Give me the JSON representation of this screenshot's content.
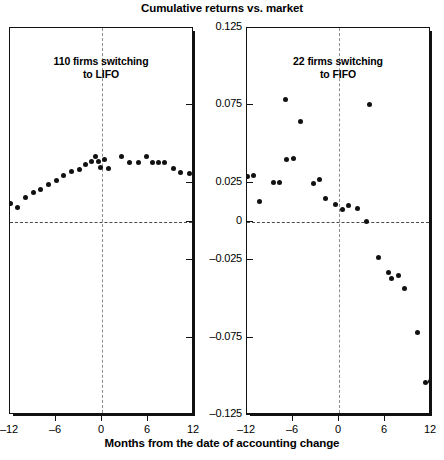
{
  "chart_data": {
    "type": "scatter",
    "title": "Cumulative returns vs. market",
    "xlabel": "Months from the date of accounting change",
    "ylabel": "",
    "xlim": [
      -12,
      12
    ],
    "ylim": [
      -0.125,
      0.125
    ],
    "xticks": [
      -12,
      -6,
      0,
      6,
      12
    ],
    "xticklabels": [
      "–12",
      "–6",
      "0",
      "6",
      "12"
    ],
    "yticks": [
      0.125,
      0.075,
      0.025,
      0,
      -0.025,
      -0.075,
      -0.125
    ],
    "yticklabels": [
      "0.125",
      "0.075",
      "0.025",
      "0",
      "–0.025",
      "–0.075",
      "–0.125"
    ],
    "grid": false,
    "legend": "none",
    "reference_lines": [
      {
        "type": "vertical",
        "x": 0,
        "style": "dashed"
      },
      {
        "type": "horizontal",
        "y": 0,
        "style": "dashed"
      }
    ],
    "panels": [
      {
        "id": "left",
        "annotation": "110 firms switching\nto LIFO",
        "annotation_line1": "110 firms switching",
        "annotation_line2": "to LIFO",
        "series": [
          {
            "name": "110 firms switching to LIFO",
            "points": [
              {
                "x": -12.0,
                "y": 0.0118
              },
              {
                "x": -11.0,
                "y": 0.009
              },
              {
                "x": -10.0,
                "y": 0.0155
              },
              {
                "x": -9.0,
                "y": 0.019
              },
              {
                "x": -8.0,
                "y": 0.0205
              },
              {
                "x": -7.0,
                "y": 0.024
              },
              {
                "x": -6.0,
                "y": 0.0268
              },
              {
                "x": -5.0,
                "y": 0.03
              },
              {
                "x": -4.0,
                "y": 0.0322
              },
              {
                "x": -3.0,
                "y": 0.0338
              },
              {
                "x": -2.2,
                "y": 0.037
              },
              {
                "x": -1.4,
                "y": 0.0385
              },
              {
                "x": -0.8,
                "y": 0.0418
              },
              {
                "x": -0.5,
                "y": 0.0388
              },
              {
                "x": -0.2,
                "y": 0.0352
              },
              {
                "x": 0.3,
                "y": 0.0398
              },
              {
                "x": 0.9,
                "y": 0.0345
              },
              {
                "x": 2.6,
                "y": 0.0418
              },
              {
                "x": 3.6,
                "y": 0.0378
              },
              {
                "x": 4.8,
                "y": 0.038
              },
              {
                "x": 5.8,
                "y": 0.0418
              },
              {
                "x": 6.6,
                "y": 0.0378
              },
              {
                "x": 7.4,
                "y": 0.0378
              },
              {
                "x": 8.2,
                "y": 0.0378
              },
              {
                "x": 9.3,
                "y": 0.034
              },
              {
                "x": 10.2,
                "y": 0.0318
              },
              {
                "x": 11.4,
                "y": 0.0312
              }
            ]
          }
        ]
      },
      {
        "id": "right",
        "annotation": "22 firms switching\nto FIFO",
        "annotation_line1": "22 firms switching",
        "annotation_line2": "to FIFO",
        "series": [
          {
            "name": "22 firms switching to FIFO",
            "points": [
              {
                "x": -11.9,
                "y": 0.0288
              },
              {
                "x": -11.2,
                "y": 0.03
              },
              {
                "x": -10.4,
                "y": 0.013
              },
              {
                "x": -8.6,
                "y": 0.025
              },
              {
                "x": -7.8,
                "y": 0.0255
              },
              {
                "x": -7.0,
                "y": 0.0785
              },
              {
                "x": -6.8,
                "y": 0.04
              },
              {
                "x": -5.9,
                "y": 0.0405
              },
              {
                "x": -5.0,
                "y": 0.0645
              },
              {
                "x": -3.3,
                "y": 0.0248
              },
              {
                "x": -2.6,
                "y": 0.0272
              },
              {
                "x": -1.7,
                "y": 0.015
              },
              {
                "x": -0.4,
                "y": 0.0108
              },
              {
                "x": 0.4,
                "y": 0.0075
              },
              {
                "x": 1.3,
                "y": 0.0105
              },
              {
                "x": 2.4,
                "y": 0.0085
              },
              {
                "x": 3.6,
                "y": 0.0
              },
              {
                "x": 4.0,
                "y": 0.0755
              },
              {
                "x": 5.2,
                "y": -0.0232
              },
              {
                "x": 6.4,
                "y": -0.033
              },
              {
                "x": 6.8,
                "y": -0.0368
              },
              {
                "x": 7.7,
                "y": -0.0348
              },
              {
                "x": 8.6,
                "y": -0.0432
              },
              {
                "x": 10.2,
                "y": -0.0718
              },
              {
                "x": 11.3,
                "y": -0.104
              },
              {
                "x": 11.9,
                "y": -0.1035
              }
            ]
          }
        ]
      }
    ]
  }
}
